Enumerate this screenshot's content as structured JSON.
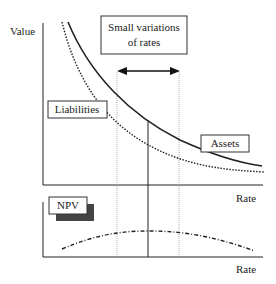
{
  "diagram": {
    "top_panel": {
      "y_axis_label": "Value",
      "x_axis_label": "Rate",
      "callout": {
        "line1": "Small variations",
        "line2": "of rates"
      },
      "curves": [
        {
          "name": "Assets",
          "style": "solid",
          "label": "Assets"
        },
        {
          "name": "Liabilities",
          "style": "dotted",
          "label": "Liabilities"
        }
      ],
      "arrow": "double-headed-horizontal"
    },
    "bottom_panel": {
      "label": "NPV",
      "x_axis_label": "Rate",
      "curve_style": "dash-dot"
    },
    "colors": {
      "line": "#222222",
      "guide": "#aaaaaa",
      "shadow": "#444444"
    }
  }
}
